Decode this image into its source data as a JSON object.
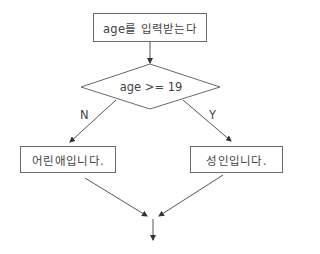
{
  "flowchart": {
    "start": {
      "label": "age를 입력받는다"
    },
    "decision": {
      "label": "age >= 19"
    },
    "branches": {
      "no": {
        "label": "N",
        "target": "어린애입니다."
      },
      "yes": {
        "label": "Y",
        "target": "성인입니다."
      }
    },
    "nodes": {
      "child": {
        "label": "어린애입니다."
      },
      "adult": {
        "label": "성인입니다."
      }
    },
    "colors": {
      "line": "#555555",
      "border": "#6a6a6a",
      "text": "#444444"
    }
  }
}
